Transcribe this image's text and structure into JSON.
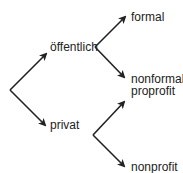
{
  "diagram": {
    "type": "tree",
    "root": "",
    "nodes": {
      "oeffentlich": "öffentlich",
      "privat": "privat",
      "formal": "formal",
      "nonformal": "nonformal",
      "proprofit": "proprofit",
      "nonprofit": "nonprofit"
    },
    "edges": [
      {
        "from": "root",
        "to": "öffentlich"
      },
      {
        "from": "root",
        "to": "privat"
      },
      {
        "from": "öffentlich",
        "to": "formal"
      },
      {
        "from": "öffentlich",
        "to": "nonformal"
      },
      {
        "from": "privat",
        "to": "proprofit"
      },
      {
        "from": "privat",
        "to": "nonprofit"
      }
    ],
    "colors": {
      "line": "#222222",
      "text": "#222222",
      "background": "#ffffff"
    }
  }
}
